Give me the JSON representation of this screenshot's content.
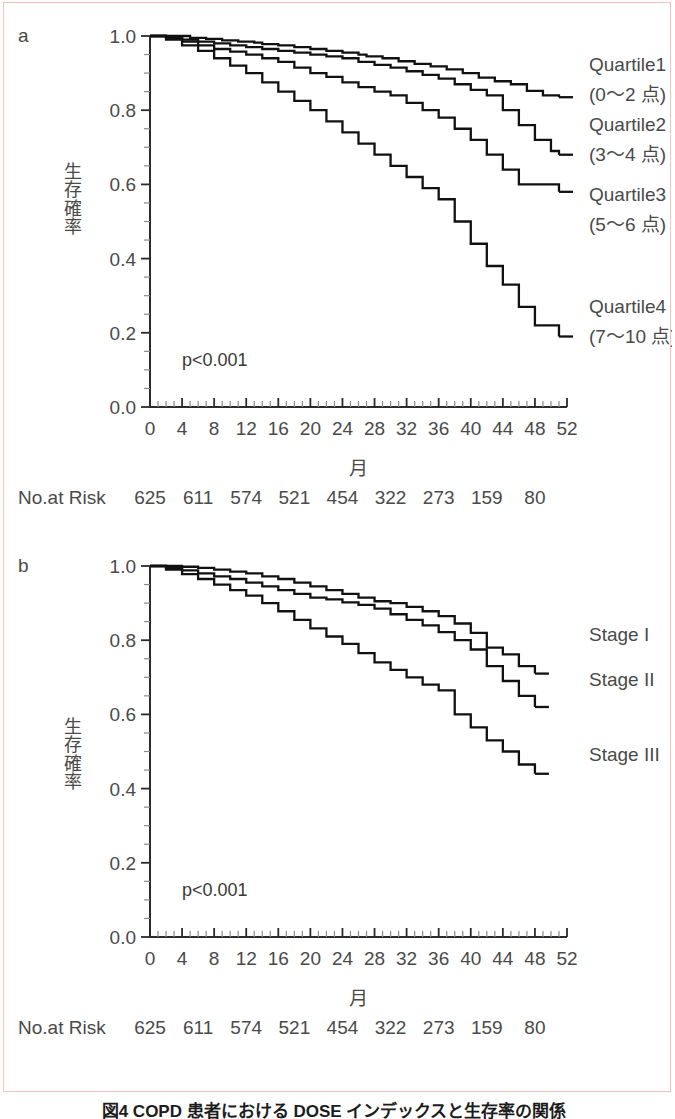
{
  "figure": {
    "panel_a_letter": "a",
    "panel_b_letter": "b",
    "caption": "図4  COPD 患者における DOSE インデックスと生存率の関係"
  },
  "axes": {
    "ylabel": "生存確率",
    "xlabel": "月",
    "y_ticks": [
      "0.0",
      "0.2",
      "0.4",
      "0.6",
      "0.8",
      "1.0"
    ],
    "y_tick_values": [
      0.0,
      0.2,
      0.4,
      0.6,
      0.8,
      1.0
    ],
    "x_ticks": [
      "0",
      "4",
      "8",
      "12",
      "16",
      "20",
      "24",
      "28",
      "32",
      "36",
      "40",
      "44",
      "48",
      "52"
    ],
    "x_tick_values": [
      0,
      4,
      8,
      12,
      16,
      20,
      24,
      28,
      32,
      36,
      40,
      44,
      48,
      52
    ],
    "xlim": [
      0,
      52
    ],
    "ylim": [
      0.0,
      1.0
    ],
    "minor_tick_step_x": 1,
    "minor_tick_step_y": 0.05,
    "grid": false
  },
  "risk_table": {
    "title": "No.at Risk",
    "months": [
      0,
      6,
      12,
      18,
      24,
      30,
      36,
      42,
      48
    ],
    "values": [
      "625",
      "611",
      "574",
      "521",
      "454",
      "322",
      "273",
      "159",
      "80"
    ]
  },
  "stats": {
    "p_value_a": "p<0.001",
    "p_value_b": "p<0.001"
  },
  "chart_data": [
    {
      "type": "line",
      "panel": "a",
      "title": "",
      "xlabel": "月",
      "ylabel": "生存確率",
      "xlim": [
        0,
        52
      ],
      "ylim": [
        0.0,
        1.0
      ],
      "grid": false,
      "legend_position": "right-inline",
      "annotations": [
        "p<0.001"
      ],
      "series": [
        {
          "name": "Quartile1",
          "sublabel": "(0〜2 点)",
          "label_line1": "Quartile1",
          "label_line2": "(0〜2 点)",
          "final_value": 0.835,
          "x": [
            0,
            3,
            5,
            7,
            9,
            11,
            13,
            14,
            16,
            18,
            20,
            22,
            24,
            26,
            27,
            29,
            31,
            33,
            35,
            37,
            39,
            41,
            43,
            45,
            47,
            49,
            51
          ],
          "y": [
            1.0,
            1.0,
            0.995,
            0.992,
            0.988,
            0.985,
            0.982,
            0.978,
            0.975,
            0.97,
            0.965,
            0.96,
            0.955,
            0.95,
            0.945,
            0.94,
            0.932,
            0.925,
            0.918,
            0.91,
            0.9,
            0.888,
            0.878,
            0.87,
            0.852,
            0.84,
            0.835
          ]
        },
        {
          "name": "Quartile2",
          "sublabel": "(3〜4 点)",
          "label_line1": "Quartile2",
          "label_line2": "(3〜4 点)",
          "final_value": 0.68,
          "x": [
            0,
            2,
            4,
            6,
            8,
            10,
            12,
            14,
            16,
            18,
            20,
            22,
            24,
            26,
            28,
            30,
            32,
            34,
            36,
            38,
            40,
            42,
            44,
            46,
            48,
            50,
            51
          ],
          "y": [
            1.0,
            0.998,
            0.99,
            0.985,
            0.98,
            0.975,
            0.97,
            0.965,
            0.96,
            0.955,
            0.95,
            0.945,
            0.94,
            0.93,
            0.922,
            0.915,
            0.905,
            0.895,
            0.885,
            0.87,
            0.855,
            0.84,
            0.8,
            0.76,
            0.72,
            0.69,
            0.68
          ]
        },
        {
          "name": "Quartile3",
          "sublabel": "(5〜6 点)",
          "label_line1": "Quartile3",
          "label_line2": "(5〜6 点)",
          "final_value": 0.58,
          "x": [
            0,
            2,
            4,
            6,
            8,
            10,
            12,
            14,
            16,
            18,
            20,
            22,
            24,
            26,
            28,
            30,
            32,
            34,
            36,
            38,
            40,
            42,
            44,
            46,
            51
          ],
          "y": [
            1.0,
            0.995,
            0.985,
            0.975,
            0.965,
            0.958,
            0.95,
            0.94,
            0.93,
            0.915,
            0.9,
            0.89,
            0.875,
            0.862,
            0.85,
            0.84,
            0.82,
            0.8,
            0.78,
            0.75,
            0.72,
            0.68,
            0.64,
            0.6,
            0.58
          ]
        },
        {
          "name": "Quartile4",
          "sublabel": "(7〜10 点)",
          "label_line1": "Quartile4",
          "label_line2": "(7〜10 点)",
          "final_value": 0.19,
          "x": [
            0,
            2,
            4,
            6,
            8,
            10,
            12,
            14,
            16,
            18,
            20,
            22,
            24,
            26,
            28,
            30,
            32,
            34,
            36,
            38,
            40,
            42,
            44,
            46,
            48,
            51
          ],
          "y": [
            1.0,
            0.99,
            0.975,
            0.96,
            0.94,
            0.92,
            0.9,
            0.875,
            0.85,
            0.825,
            0.8,
            0.77,
            0.74,
            0.71,
            0.68,
            0.65,
            0.62,
            0.59,
            0.56,
            0.5,
            0.44,
            0.38,
            0.33,
            0.27,
            0.22,
            0.19
          ]
        }
      ]
    },
    {
      "type": "line",
      "panel": "b",
      "title": "",
      "xlabel": "月",
      "ylabel": "生存確率",
      "xlim": [
        0,
        52
      ],
      "ylim": [
        0.0,
        1.0
      ],
      "grid": false,
      "legend_position": "right-inline",
      "annotations": [
        "p<0.001"
      ],
      "series": [
        {
          "name": "Stage I",
          "sublabel": "",
          "label_line1": "Stage I",
          "label_line2": "",
          "final_value": 0.71,
          "x": [
            0,
            2,
            4,
            6,
            8,
            10,
            12,
            14,
            16,
            18,
            20,
            22,
            24,
            26,
            28,
            30,
            32,
            34,
            36,
            38,
            40,
            42,
            44,
            46,
            48
          ],
          "y": [
            1.0,
            1.0,
            0.998,
            0.995,
            0.99,
            0.985,
            0.98,
            0.972,
            0.965,
            0.955,
            0.945,
            0.935,
            0.925,
            0.915,
            0.905,
            0.9,
            0.89,
            0.878,
            0.865,
            0.845,
            0.82,
            0.78,
            0.762,
            0.73,
            0.71
          ]
        },
        {
          "name": "Stage II",
          "sublabel": "",
          "label_line1": "Stage II",
          "label_line2": "",
          "final_value": 0.62,
          "x": [
            0,
            2,
            4,
            6,
            8,
            10,
            12,
            14,
            16,
            18,
            20,
            22,
            24,
            26,
            28,
            30,
            32,
            34,
            36,
            38,
            40,
            42,
            44,
            46,
            48
          ],
          "y": [
            1.0,
            0.995,
            0.988,
            0.98,
            0.972,
            0.965,
            0.955,
            0.945,
            0.935,
            0.925,
            0.915,
            0.91,
            0.902,
            0.895,
            0.885,
            0.87,
            0.855,
            0.84,
            0.822,
            0.8,
            0.775,
            0.73,
            0.69,
            0.65,
            0.62
          ]
        },
        {
          "name": "Stage III",
          "sublabel": "",
          "label_line1": "Stage III",
          "label_line2": "",
          "final_value": 0.44,
          "x": [
            0,
            2,
            4,
            6,
            8,
            10,
            12,
            14,
            16,
            18,
            20,
            22,
            24,
            26,
            28,
            30,
            32,
            34,
            36,
            38,
            40,
            42,
            44,
            46,
            48
          ],
          "y": [
            1.0,
            0.99,
            0.978,
            0.965,
            0.95,
            0.935,
            0.92,
            0.9,
            0.878,
            0.855,
            0.832,
            0.81,
            0.79,
            0.765,
            0.74,
            0.72,
            0.7,
            0.68,
            0.665,
            0.6,
            0.565,
            0.53,
            0.5,
            0.465,
            0.44
          ]
        }
      ]
    }
  ]
}
